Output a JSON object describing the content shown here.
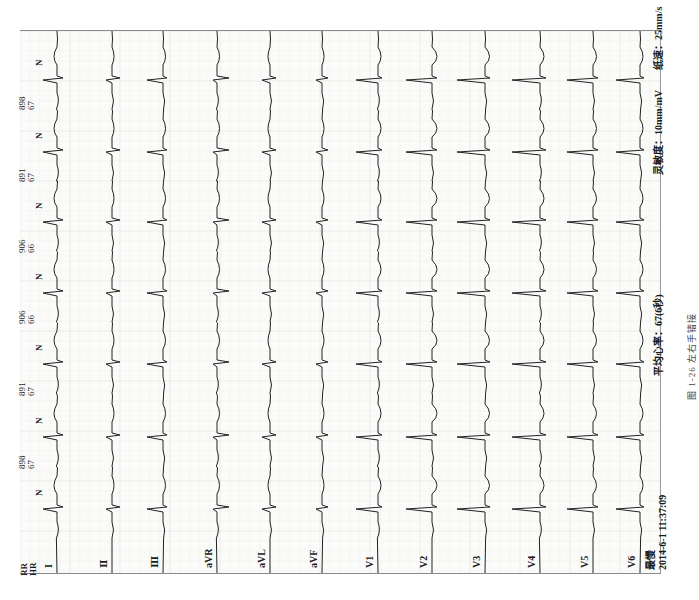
{
  "figure": {
    "caption": "图 1-26   左右手错接",
    "orientation": "rotated 90° counter-clockwise"
  },
  "header": {
    "rr_label": "RR",
    "hr_label": "HR",
    "beat_annotation": "N",
    "intervals": [
      {
        "rr": "898",
        "hr": "67"
      },
      {
        "rr": "891",
        "hr": "67"
      },
      {
        "rr": "906",
        "hr": "66"
      },
      {
        "rr": "906",
        "hr": "66"
      },
      {
        "rr": "891",
        "hr": "67"
      },
      {
        "rr": "898",
        "hr": "67"
      }
    ]
  },
  "leads": [
    {
      "label": "I"
    },
    {
      "label": "Ⅱ"
    },
    {
      "label": "Ⅲ"
    },
    {
      "label": "aVR"
    },
    {
      "label": "aVL"
    },
    {
      "label": "aVF"
    },
    {
      "label": "V1"
    },
    {
      "label": "V2"
    },
    {
      "label": "V3"
    },
    {
      "label": "V4"
    },
    {
      "label": "V5"
    },
    {
      "label": "V6"
    }
  ],
  "footer": {
    "filter_label": "最慢",
    "timestamp": "2014-6-1 11:37:09",
    "avg_heart_rate": "平均心率：67(6秒)",
    "sensitivity": "灵敏度：10mm/mV",
    "paper_speed": "纸速：25mm/s"
  },
  "colors": {
    "paper": "#fbfbfa",
    "grid": "#e4e4e4",
    "trace": "#222222",
    "border": "#8a8a8a"
  }
}
